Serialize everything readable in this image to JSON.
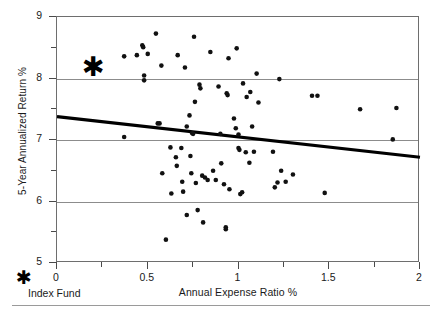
{
  "chart_data": {
    "type": "scatter",
    "title": "",
    "xlabel": "Annual Expense Ratio %",
    "ylabel": "5-Year Annualized Return %",
    "xlim": [
      0,
      2
    ],
    "ylim": [
      5,
      9
    ],
    "grid": "horizontal-major-only",
    "x_ticks": [
      0,
      0.5,
      1,
      1.5,
      2
    ],
    "x_tick_labels": [
      "0",
      "0.5",
      "1",
      "1.5",
      "2"
    ],
    "x_minor_ticks": [
      0.25,
      0.75,
      1.25,
      1.75
    ],
    "y_ticks": [
      5,
      6,
      7,
      8,
      9
    ],
    "y_tick_labels": [
      "5",
      "6",
      "7",
      "8",
      "9"
    ],
    "y_minor_ticks": [
      5.5,
      6.5,
      7.5,
      8.5
    ],
    "legend_position": "below-left",
    "series": [
      {
        "name": "Managed funds",
        "marker": "dot",
        "color": "#111111",
        "points": [
          [
            0.37,
            8.36
          ],
          [
            0.37,
            7.05
          ],
          [
            0.44,
            8.38
          ],
          [
            0.47,
            8.54
          ],
          [
            0.475,
            8.51
          ],
          [
            0.48,
            8.05
          ],
          [
            0.48,
            7.97
          ],
          [
            0.5,
            8.4
          ],
          [
            0.545,
            8.73
          ],
          [
            0.555,
            7.27
          ],
          [
            0.565,
            7.27
          ],
          [
            0.575,
            8.21
          ],
          [
            0.58,
            6.46
          ],
          [
            0.6,
            5.38
          ],
          [
            0.625,
            6.88
          ],
          [
            0.63,
            6.13
          ],
          [
            0.655,
            6.72
          ],
          [
            0.66,
            6.58
          ],
          [
            0.665,
            8.38
          ],
          [
            0.685,
            6.87
          ],
          [
            0.69,
            6.32
          ],
          [
            0.695,
            6.16
          ],
          [
            0.705,
            8.18
          ],
          [
            0.715,
            7.22
          ],
          [
            0.715,
            5.78
          ],
          [
            0.73,
            7.4
          ],
          [
            0.735,
            6.74
          ],
          [
            0.74,
            6.46
          ],
          [
            0.745,
            7.11
          ],
          [
            0.75,
            7.1
          ],
          [
            0.755,
            8.68
          ],
          [
            0.76,
            7.62
          ],
          [
            0.765,
            6.3
          ],
          [
            0.775,
            5.86
          ],
          [
            0.785,
            7.9
          ],
          [
            0.79,
            7.84
          ],
          [
            0.8,
            6.42
          ],
          [
            0.805,
            5.66
          ],
          [
            0.815,
            6.39
          ],
          [
            0.83,
            6.35
          ],
          [
            0.845,
            8.43
          ],
          [
            0.86,
            6.5
          ],
          [
            0.875,
            6.35
          ],
          [
            0.89,
            7.87
          ],
          [
            0.9,
            7.1
          ],
          [
            0.905,
            6.62
          ],
          [
            0.92,
            6.28
          ],
          [
            0.93,
            5.58
          ],
          [
            0.93,
            5.55
          ],
          [
            0.935,
            7.76
          ],
          [
            0.94,
            7.73
          ],
          [
            0.945,
            8.33
          ],
          [
            0.95,
            6.2
          ],
          [
            0.975,
            7.35
          ],
          [
            0.985,
            7.19
          ],
          [
            0.99,
            8.49
          ],
          [
            1.0,
            7.09
          ],
          [
            1.0,
            6.87
          ],
          [
            1.005,
            6.84
          ],
          [
            1.01,
            6.12
          ],
          [
            1.02,
            6.15
          ],
          [
            1.025,
            7.92
          ],
          [
            1.04,
            6.8
          ],
          [
            1.045,
            7.7
          ],
          [
            1.06,
            6.63
          ],
          [
            1.065,
            7.78
          ],
          [
            1.075,
            7.22
          ],
          [
            1.085,
            6.81
          ],
          [
            1.1,
            8.08
          ],
          [
            1.11,
            7.61
          ],
          [
            1.19,
            6.81
          ],
          [
            1.2,
            6.23
          ],
          [
            1.215,
            6.31
          ],
          [
            1.225,
            7.99
          ],
          [
            1.235,
            6.5
          ],
          [
            1.26,
            6.32
          ],
          [
            1.3,
            6.44
          ],
          [
            1.405,
            7.72
          ],
          [
            1.435,
            7.72
          ],
          [
            1.475,
            6.14
          ],
          [
            1.67,
            7.5
          ],
          [
            1.85,
            7.01
          ],
          [
            1.87,
            7.52
          ]
        ]
      },
      {
        "name": "Index Fund",
        "marker": "star",
        "color": "#000000",
        "points": [
          [
            0.2,
            8.21
          ]
        ]
      }
    ],
    "trendline": {
      "style": "solid-thick",
      "color": "#000000",
      "x_start": 0,
      "y_start": 7.38,
      "x_end": 2,
      "y_end": 6.72
    },
    "annotations": []
  },
  "legend": {
    "star_glyph": "✱",
    "label": "Index Fund"
  }
}
